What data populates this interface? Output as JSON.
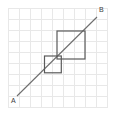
{
  "figure": {
    "type": "geometry-diagram",
    "canvas": {
      "width": 117,
      "height": 117,
      "background": "#ffffff"
    },
    "grid": {
      "visible": true,
      "origin_x": 8,
      "origin_y": 8,
      "cell_size": 11.2,
      "columns": 9,
      "rows": 9,
      "color": "#e8e8e8",
      "line_width": 1
    },
    "line": {
      "name": "AB",
      "color": "#6e6e6e",
      "width": 1.1,
      "start": {
        "label": "A",
        "x": 17,
        "y": 96
      },
      "end": {
        "label": "B",
        "x": 97,
        "y": 17
      }
    },
    "labels": [
      {
        "id": "label-a",
        "text": "A",
        "x": 11,
        "y": 103
      },
      {
        "id": "label-b",
        "text": "B",
        "x": 99,
        "y": 12
      }
    ],
    "squares": [
      {
        "id": "small-square",
        "name": "lower-left-square",
        "x": 44.5,
        "y": 56.0,
        "width": 16.8,
        "height": 16.8,
        "color": "#5a5a5a"
      },
      {
        "id": "large-square",
        "name": "upper-right-square",
        "x": 57.0,
        "y": 31.0,
        "width": 28.0,
        "height": 28.0,
        "color": "#5a5a5a"
      }
    ]
  }
}
